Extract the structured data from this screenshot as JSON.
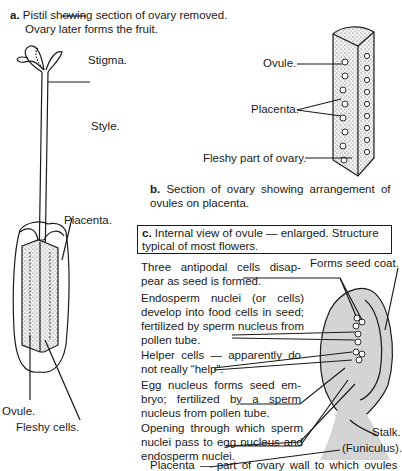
{
  "figure_a": {
    "letter": "a.",
    "caption_line1": "Pistil showing section of ovary removed.",
    "caption_line2": "Ovary later forms the fruit.",
    "labels": {
      "stigma": "Stigma.",
      "style": "Style.",
      "placenta": "Placenta.",
      "ovule": "Ovule.",
      "fleshy_cells": "Fleshy cells."
    }
  },
  "figure_b": {
    "letter": "b.",
    "caption_line1": "Section of ovary showing arrangement of",
    "caption_line2": "ovules on placenta.",
    "labels": {
      "ovule": "Ovule.",
      "placenta": "Placenta.",
      "fleshy_part": "Fleshy part of ovary."
    }
  },
  "figure_c": {
    "letter": "c.",
    "caption_line1": "Internal view of ovule — enlarged. Structure",
    "caption_line2": "typical of most flowers.",
    "labels": {
      "seed_coat": "Forms seed coat.",
      "antipodal": "Three antipodal cells disap- pear as seed is formed.",
      "endosperm": "Endosperm nuclei (or cells) develop into food cells in seed; fertilized by sperm nucleus from pollen tube.",
      "helper": "Helper cells — apparently do not really “help”.",
      "egg": "Egg nucleus forms seed em- bryo; fertilized by a sperm nucleus from pollen tube.",
      "opening": "Opening through which sperm nuclei pass to egg nucleus and endosperm nuclei.",
      "stalk": "Stalk.",
      "funiculus": "(Funiculus).",
      "placenta_note": "Placenta — part of ovary wall to which ovules"
    }
  },
  "colors": {
    "ink": "#1a1a1a",
    "ovule_fill": "#d4d4d4",
    "tissue_fill": "#e6e6e6",
    "background": "#ffffff"
  }
}
